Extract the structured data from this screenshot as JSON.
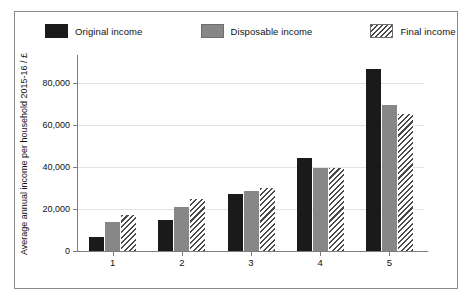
{
  "chart_data": {
    "type": "bar",
    "title": "",
    "xlabel": "",
    "ylabel": "Average annual income per household 2015-16 / £",
    "categories": [
      "1",
      "2",
      "3",
      "4",
      "5"
    ],
    "ylim": [
      0,
      90000
    ],
    "yticks": [
      0,
      20000,
      40000,
      60000,
      80000
    ],
    "ytick_labels": [
      "0",
      "20,000",
      "40,000",
      "60,000",
      "80,000"
    ],
    "grid": true,
    "legend_position": "top",
    "series": [
      {
        "name": "Original income",
        "style": "solid-black",
        "color": "#1a1a1a",
        "values": [
          6700,
          14300,
          26700,
          43300,
          85000
        ]
      },
      {
        "name": "Disposable income",
        "style": "solid-gray",
        "color": "#878787",
        "values": [
          13300,
          20500,
          28100,
          38800,
          68000
        ]
      },
      {
        "name": "Final income",
        "style": "diagonal-hatch",
        "color": "#4a4a4a",
        "values": [
          16800,
          24300,
          29300,
          38500,
          64000
        ]
      }
    ]
  },
  "legend": {
    "items": [
      {
        "label": "Original income",
        "swatch": "solid-black-swatch"
      },
      {
        "label": "Disposable income",
        "swatch": "solid-gray-swatch"
      },
      {
        "label": "Final income",
        "swatch": "hatched-swatch"
      }
    ]
  },
  "axes": {
    "y_title": "Average annual income per household 2015-16 / £",
    "y_labels": [
      "80,000",
      "60,000",
      "40,000",
      "20,000",
      "0"
    ],
    "x_labels": [
      "1",
      "2",
      "3",
      "4",
      "5"
    ]
  },
  "caption": {
    "fragment": ""
  }
}
